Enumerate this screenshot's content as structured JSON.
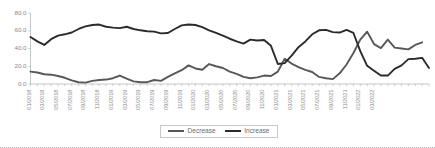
{
  "chart_data": {
    "type": "line",
    "title": "",
    "xlabel": "",
    "ylabel": "",
    "ylim": [
      0,
      80
    ],
    "ytick_labels": [
      "0.0",
      "20.0",
      "40.0",
      "60.0",
      "80.0"
    ],
    "ytick_values": [
      0,
      20,
      40,
      60,
      80
    ],
    "grid": false,
    "legend_position": "bottom-center",
    "x": [
      "01/2018",
      "02/2018",
      "03/2018",
      "04/2018",
      "05/2018",
      "06/2018",
      "07/2018",
      "08/2018",
      "09/2018",
      "10/2018",
      "11/2018",
      "12/2018",
      "01/2019",
      "02/2019",
      "03/2019",
      "04/2019",
      "05/2019",
      "06/2019",
      "07/2019",
      "08/2019",
      "09/2019",
      "10/2019",
      "11/2019",
      "12/2019",
      "01/2020",
      "02/2020",
      "03/2020",
      "04/2020",
      "05/2020",
      "06/2020",
      "07/2020",
      "08/2020",
      "09/2020",
      "10/2020",
      "11/2020",
      "12/2020",
      "01/2021",
      "02/2021",
      "03/2021",
      "04/2021",
      "05/2021",
      "06/2021",
      "07/2021",
      "08/2021",
      "09/2021",
      "10/2021",
      "11/2021",
      "12/2021",
      "01/2022",
      "02/2022",
      "03/2022",
      "04/2022"
    ],
    "xtick_labels": [
      "01/2018",
      "03/2018",
      "05/2018",
      "07/2018",
      "09/2018",
      "11/2018",
      "01/2019",
      "03/2019",
      "05/2019",
      "07/2019",
      "09/2019",
      "11/2019",
      "01/2020",
      "03/2020",
      "05/2020",
      "07/2020",
      "09/2020",
      "11/2020",
      "01/2021",
      "03/2021",
      "05/2021",
      "07/2021",
      "09/2021",
      "11/2021",
      "01/2022",
      "03/2022"
    ],
    "series": [
      {
        "name": "Decrease",
        "color": "#585858",
        "values": [
          14.0,
          13.0,
          11.0,
          10.5,
          9.0,
          7.0,
          4.0,
          2.0,
          1.5,
          3.5,
          4.5,
          5.0,
          6.5,
          9.5,
          6.0,
          3.0,
          2.0,
          2.0,
          4.5,
          3.5,
          8.0,
          12.0,
          15.5,
          21.0,
          17.5,
          16.0,
          22.5,
          20.0,
          18.0,
          14.0,
          11.5,
          8.0,
          6.5,
          7.5,
          9.5,
          9.0,
          14.0,
          28.5,
          23.0,
          19.0,
          16.0,
          13.5,
          8.0,
          6.5,
          5.5,
          12.0,
          22.0,
          35.0,
          50.0,
          59.0,
          45.0,
          40.5
        ]
      },
      {
        "name": "Increase",
        "color": "#2b2b2b",
        "values": [
          53.0,
          48.0,
          44.0,
          50.5,
          54.5,
          56.0,
          58.0,
          62.0,
          65.0,
          66.5,
          67.0,
          64.5,
          63.5,
          63.0,
          64.5,
          62.0,
          60.5,
          59.5,
          59.0,
          57.0,
          57.5,
          62.0,
          66.0,
          67.0,
          66.5,
          64.0,
          60.5,
          57.5,
          54.5,
          51.0,
          48.0,
          45.5,
          50.0,
          49.0,
          49.5,
          43.0,
          22.5,
          23.5,
          32.0,
          41.5,
          48.0,
          56.0,
          60.5,
          61.0,
          58.5,
          58.0,
          61.0,
          57.5,
          37.0,
          20.5,
          15.0,
          9.5
        ]
      }
    ],
    "series_extended": {
      "note": "Values continue beyond the primary crossing to chart end",
      "decrease_tail": [
        50.0,
        41.0,
        40.0,
        39.0,
        44.0,
        47.0
      ],
      "increase_tail": [
        9.5,
        17.0,
        21.0,
        28.0,
        28.5,
        29.5,
        18.0
      ]
    }
  },
  "legend": {
    "items": [
      {
        "label": "Decrease",
        "color": "#585858"
      },
      {
        "label": "Increase",
        "color": "#2b2b2b"
      }
    ]
  }
}
